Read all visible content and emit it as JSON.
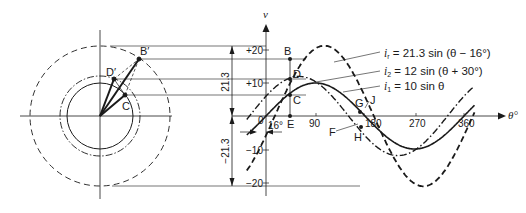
{
  "figure": {
    "phasor_diagram": {
      "points": {
        "B_prime": "B′",
        "D_prime": "D′",
        "C": "C"
      },
      "circles": [
        {
          "name": "i_r",
          "radius_value": 21.3,
          "style": "dashed"
        },
        {
          "name": "i_2",
          "radius_value": 12,
          "style": "dash-dot"
        },
        {
          "name": "i_1",
          "radius_value": 10,
          "style": "solid"
        }
      ]
    },
    "waveform": {
      "y_axis_label": "v",
      "x_axis_label": "θ°",
      "y_ticks": [
        "+20",
        "+10",
        "−10",
        "−20"
      ],
      "x_ticks": [
        "0",
        "90",
        "180",
        "270",
        "360"
      ],
      "dimension_labels": {
        "upper": "21.3",
        "lower": "−21.3",
        "phase_shift": "16°"
      },
      "point_labels": {
        "B": "B",
        "D": "D",
        "C": "C",
        "E": "E",
        "F": "F",
        "G": "G",
        "H": "H",
        "J": "J"
      },
      "equations": [
        {
          "lhs": "i",
          "sub": "r",
          "rhs": " = 21.3 sin (θ − 16°)"
        },
        {
          "lhs": "i",
          "sub": "2",
          "rhs": " = 12 sin (θ + 30°)"
        },
        {
          "lhs": "i",
          "sub": "1",
          "rhs": " = 10 sin θ"
        }
      ]
    }
  },
  "chart_data": {
    "type": "line",
    "title": "",
    "xlabel": "θ°",
    "ylabel": "v",
    "x_ticks": [
      0,
      90,
      180,
      270,
      360
    ],
    "y_ticks": [
      20,
      10,
      -10,
      -20
    ],
    "xlim": [
      -30,
      380
    ],
    "ylim": [
      -21.3,
      21.3
    ],
    "series": [
      {
        "name": "i_r = 21.3 sin (θ − 16°)",
        "amplitude": 21.3,
        "phase_deg": -16,
        "style": "dashed"
      },
      {
        "name": "i_2 = 12 sin (θ + 30°)",
        "amplitude": 12,
        "phase_deg": 30,
        "style": "dash-dot"
      },
      {
        "name": "i_1 = 10 sin θ",
        "amplitude": 10,
        "phase_deg": 0,
        "style": "solid"
      }
    ],
    "annotations": [
      "B",
      "C",
      "D",
      "E",
      "F",
      "G",
      "H",
      "J",
      "16°",
      "21.3",
      "−21.3"
    ]
  }
}
